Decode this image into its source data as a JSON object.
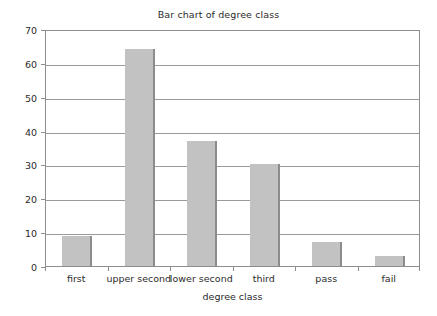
{
  "chart_data": {
    "type": "bar",
    "title": "Bar chart of degree class",
    "xlabel": "degree class",
    "ylabel": "",
    "categories": [
      "first",
      "upper second",
      "lower second",
      "third",
      "pass",
      "fail"
    ],
    "values": [
      9,
      64,
      37,
      30,
      7,
      3
    ],
    "ylim": [
      0,
      70
    ],
    "yticks": [
      0,
      10,
      20,
      30,
      40,
      50,
      60,
      70
    ],
    "ytick_labels": [
      "0",
      "10",
      "20",
      "30",
      "40",
      "50",
      "60",
      "70"
    ],
    "grid": true,
    "legend": null,
    "series": [
      {
        "name": "degree class",
        "values": [
          9,
          64,
          37,
          30,
          7,
          3
        ]
      }
    ],
    "colors": {
      "bar_fill": "#c2c2c2",
      "bar_edge": "#8c8c8c",
      "gridline": "#9a9a9a",
      "axis": "#8e8e8e",
      "text": "#2b2b2b",
      "background": "#ffffff"
    }
  }
}
